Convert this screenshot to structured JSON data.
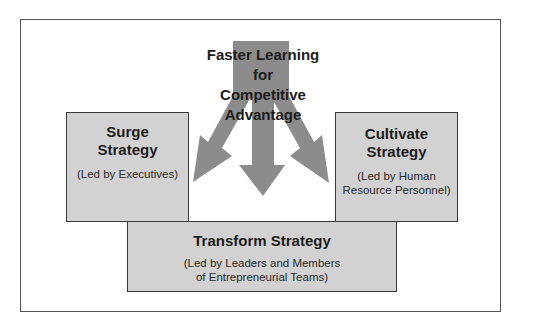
{
  "diagram": {
    "center": {
      "lines": [
        "Faster Learning",
        "for",
        "Competitive",
        "Advantage"
      ]
    },
    "boxes": {
      "surge": {
        "title_lines": [
          "Surge",
          "Strategy"
        ],
        "subtitle_lines": [
          "(Led by Executives)"
        ]
      },
      "cultivate": {
        "title_lines": [
          "Cultivate",
          "Strategy"
        ],
        "subtitle_lines": [
          "(Led by Human",
          "Resource Personnel)"
        ]
      },
      "transform": {
        "title_lines": [
          "Transform Strategy"
        ],
        "subtitle_lines": [
          "(Led by Leaders and Members",
          "of Entrepreneurial Teams)"
        ]
      }
    },
    "arrows": [
      "to-surge",
      "to-transform",
      "to-cultivate"
    ],
    "colors": {
      "arrow": "#8c8c8c",
      "box_fill": "#d2d2d2",
      "box_border": "#3a3a3a",
      "frame_border": "#555555"
    }
  }
}
